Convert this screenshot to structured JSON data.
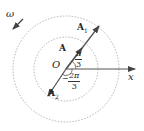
{
  "diagram": {
    "type": "phasor-rotating-vector",
    "labels": {
      "omega": "ω",
      "origin": "O",
      "x_axis": "x",
      "vector_A": "A",
      "vector_A1": "A",
      "vector_A1_sub": "1",
      "vector_A2": "A",
      "vector_A2_sub": "2"
    },
    "angles": {
      "angle1": {
        "numerator": "π",
        "denominator": "3"
      },
      "angle2": {
        "numerator": "2π",
        "denominator": "3",
        "sign": "−"
      }
    },
    "circles": [
      {
        "name": "inner",
        "style": "dashed"
      },
      {
        "name": "outer",
        "style": "dashed"
      }
    ],
    "colors": {
      "line": "#555555",
      "circle": "#aaaaaa",
      "text": "#222222"
    }
  }
}
